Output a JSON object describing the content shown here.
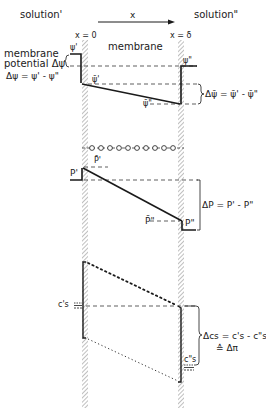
{
  "header": {
    "solution_left": "solution'",
    "solution_right": "solution\"",
    "axis_label": "x",
    "x0_label": "x = 0",
    "xdelta_label": "x = δ",
    "membrane_label": "membrane"
  },
  "potential_panel": {
    "title_line1": "membrane",
    "title_line2": "potential Δψ",
    "definition": "Δψ = ψ' - ψ\"",
    "psi_left": "ψ'",
    "psi_right": "ψ\"",
    "psibar_left": "ψ̄'",
    "psibar_right": "ψ̄\"",
    "delta_psibar": "Δψ̄ = ψ̄' - ψ̄\""
  },
  "pressure_panel": {
    "p_left": "P'",
    "pbar_left": "P̄'",
    "pbar_right": "P̄\"",
    "p_right": "P\"",
    "delta_p": "ΔP = P' - P\""
  },
  "concentration_panel": {
    "cs_left": "c's",
    "cs_right": "c\"s",
    "delta_cs_line1": "Δcs = c's - c\"s",
    "delta_cs_line2": "≙ Δπ"
  },
  "colors": {
    "ink": "#1a1a1a",
    "hatch": "#8a8a8a",
    "background": "#ffffff"
  }
}
